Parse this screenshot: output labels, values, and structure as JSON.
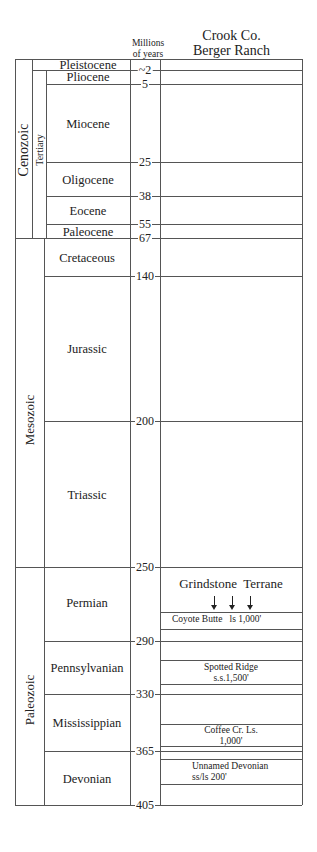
{
  "header": {
    "age_column_title_line1": "Millions",
    "age_column_title_line2": "of years",
    "section_title_line1": "Crook Co.",
    "section_title_line2": "Berger Ranch"
  },
  "eras": [
    {
      "name": "Cenozoic",
      "top_ma": 0,
      "bottom_ma": 67
    },
    {
      "name": "Mesozoic",
      "top_ma": 67,
      "bottom_ma": 250
    },
    {
      "name": "Paleozoic",
      "top_ma": 250,
      "bottom_ma": 405
    }
  ],
  "subera": {
    "name": "Tertiary",
    "top_ma": 2,
    "bottom_ma": 67
  },
  "periods": [
    {
      "name": "Pleistocene",
      "top": 0,
      "bottom": 2
    },
    {
      "name": "Pliocene",
      "top": 2,
      "bottom": 5
    },
    {
      "name": "Miocene",
      "top": 5,
      "bottom": 25
    },
    {
      "name": "Oligocene",
      "top": 25,
      "bottom": 38
    },
    {
      "name": "Eocene",
      "top": 38,
      "bottom": 55
    },
    {
      "name": "Paleocene",
      "top": 55,
      "bottom": 67
    },
    {
      "name": "Cretaceous",
      "top": 67,
      "bottom": 140
    },
    {
      "name": "Jurassic",
      "top": 140,
      "bottom": 200
    },
    {
      "name": "Triassic",
      "top": 200,
      "bottom": 250
    },
    {
      "name": "Permian",
      "top": 250,
      "bottom": 290
    },
    {
      "name": "Pennsylvanian",
      "top": 290,
      "bottom": 330
    },
    {
      "name": "Mississippian",
      "top": 330,
      "bottom": 365
    },
    {
      "name": "Devonian",
      "top": 365,
      "bottom": 405
    }
  ],
  "age_ticks": [
    "~2",
    "5",
    "25",
    "38",
    "55",
    "67",
    "140",
    "200",
    "250",
    "290",
    "330",
    "365",
    "405"
  ],
  "section": {
    "terrane_label": "Grindstone  Terrane",
    "units": [
      {
        "name": "Coyote Butte",
        "detail": "ls 1,000'"
      },
      {
        "name": "Spotted Ridge",
        "detail": "s.s.1,500'"
      },
      {
        "name": "Coffee Cr. Ls.",
        "detail": "1,000'"
      },
      {
        "name": "Unnamed Devonian",
        "detail": "ss/ls  200'"
      }
    ]
  }
}
